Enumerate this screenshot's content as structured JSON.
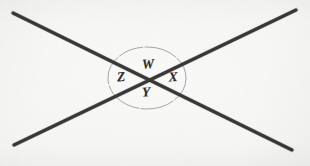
{
  "figure": {
    "kind": "geometry-diagram",
    "canvas": {
      "width": 310,
      "height": 166
    },
    "background_color": "#f5f5f3",
    "ink_color": "#2b2b2b",
    "circle_color": "#9a9a9a"
  },
  "lines": [
    {
      "name": "line-down-right",
      "x1": 13,
      "y1": 13,
      "x2": 292,
      "y2": 150,
      "stroke_width": 3.1
    },
    {
      "name": "line-up-right",
      "x1": 14,
      "y1": 145,
      "x2": 296,
      "y2": 10,
      "stroke_width": 3.1
    }
  ],
  "intersection": {
    "x": 147,
    "y": 80
  },
  "circle": {
    "cx": 147,
    "cy": 78,
    "rx": 39,
    "ry": 31,
    "stroke_width": 0.9
  },
  "angle_labels": [
    {
      "id": "w",
      "text": "W",
      "position": "top",
      "x": 148,
      "y": 64
    },
    {
      "id": "x",
      "text": "X",
      "position": "right",
      "x": 173,
      "y": 77
    },
    {
      "id": "y",
      "text": "Y",
      "position": "bottom",
      "x": 146,
      "y": 92
    },
    {
      "id": "z",
      "text": "Z",
      "position": "left",
      "x": 121,
      "y": 77
    }
  ]
}
